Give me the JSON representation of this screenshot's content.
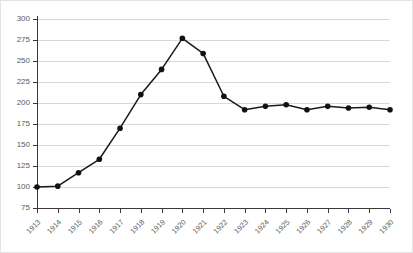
{
  "chart_data": {
    "type": "line",
    "title": "",
    "xlabel": "",
    "ylabel": "",
    "categories": [
      "1913",
      "1914",
      "1915",
      "1916",
      "1917",
      "1918",
      "1919",
      "1920",
      "1921",
      "1922",
      "1923",
      "1924",
      "1925",
      "1926",
      "1927",
      "1928",
      "1929",
      "1930"
    ],
    "values": [
      100,
      101,
      117,
      133,
      170,
      210,
      240,
      277,
      259,
      208,
      192,
      196,
      198,
      192,
      196,
      194,
      195,
      192
    ],
    "series": [
      {
        "name": "Index",
        "values": [
          100,
          101,
          117,
          133,
          170,
          210,
          240,
          277,
          259,
          208,
          192,
          196,
          198,
          192,
          196,
          194,
          195,
          192
        ]
      }
    ],
    "ylim": [
      75,
      300
    ],
    "ytick_labels": [
      "300",
      "275",
      "250",
      "225",
      "200",
      "175",
      "150",
      "125",
      "100",
      "75"
    ],
    "ytick_values": [
      300,
      275,
      250,
      225,
      200,
      175,
      150,
      125,
      100,
      75
    ],
    "xtick_labels": [
      "1913",
      "1914",
      "1915",
      "1916",
      "1917",
      "1918",
      "1919",
      "1920",
      "1921",
      "1922",
      "1923",
      "1924",
      "1925",
      "1926",
      "1927",
      "1928",
      "1929",
      "1930"
    ],
    "grid": true,
    "legend": "none",
    "marker": "circle",
    "colors": {
      "line": "#1a1a1a",
      "marker": "#111111",
      "grid": "#d9d9d9",
      "axis": "#3a3a3a",
      "tick_text": "#5a5a5a",
      "background": "#ffffff",
      "border": "#e4e4e4"
    }
  }
}
